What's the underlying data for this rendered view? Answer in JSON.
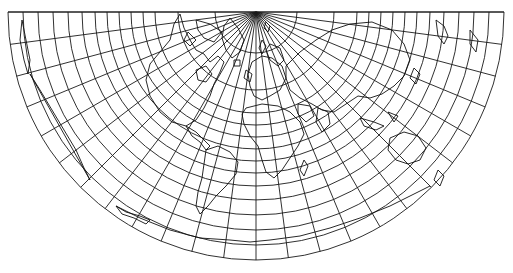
{
  "map": {
    "projection": "conic",
    "type": "world-graticule-with-coastlines",
    "colors": {
      "background": "#ffffff",
      "graticule": "#1a1a1a",
      "coastline": "#111111"
    },
    "apex": {
      "x": 256,
      "y": 12
    },
    "clip_top_y": 12,
    "outer_radius": 248,
    "fan_angle_start_deg": 0,
    "fan_angle_end_deg": 180,
    "meridian_step_map_deg": 7.5,
    "meridian_count": 25,
    "parallel_radii": [
      41,
      78,
      101,
      113,
      125,
      137,
      149,
      161,
      174,
      188,
      203,
      218,
      233,
      248
    ],
    "coastlines": [
      {
        "name": "greenland",
        "d": "M230 18 L238 28 L244 40 L240 52 L232 58 L226 50 L222 38 L224 26 Z"
      },
      {
        "name": "svalbard",
        "d": "M266 22 L270 26 L268 32 L264 28 Z"
      },
      {
        "name": "novaya-zemlya",
        "d": "M262 40 L266 46 L262 54 L259 48 Z"
      },
      {
        "name": "canadian-archipelago",
        "d": "M196 20 L210 24 L222 32 L214 42 L204 38 L198 30 Z M188 32 L196 40 L190 46 L184 40 Z"
      },
      {
        "name": "north-america",
        "d": "M180 14 L174 24 L170 40 L160 52 L150 64 L146 80 L150 96 L160 112 L172 122 L186 126 L196 120 L204 108 L210 96 L214 84 L220 72 L224 62 L218 56 L210 62 L204 54 L196 50 L190 40 L184 28 Z"
      },
      {
        "name": "hudson-bay",
        "d": "M196 70 L206 66 L212 74 L206 82 L198 80 Z"
      },
      {
        "name": "central-america",
        "d": "M186 126 L192 136 L200 142 L206 150 L210 146 L204 140 L196 132 Z"
      },
      {
        "name": "south-america",
        "d": "M206 150 L218 146 L230 152 L238 162 L236 174 L226 186 L216 196 L208 206 L200 214 L196 206 L198 192 L202 178 L204 164 Z"
      },
      {
        "name": "europe",
        "d": "M252 62 L262 56 L272 58 L282 66 L286 78 L280 90 L270 96 L262 100 L254 96 L250 86 L248 74 Z"
      },
      {
        "name": "scandinavia",
        "d": "M270 44 L280 48 L284 60 L278 66 L270 60 L266 50 Z"
      },
      {
        "name": "british-isles",
        "d": "M246 70 L252 74 L250 82 L244 78 Z"
      },
      {
        "name": "iceland",
        "d": "M234 60 L240 60 L240 66 L234 66 Z"
      },
      {
        "name": "africa",
        "d": "M246 108 L262 104 L278 106 L290 112 L300 122 L304 134 L298 146 L290 158 L282 170 L274 178 L266 172 L262 160 L258 146 L250 136 L244 124 L242 114 Z"
      },
      {
        "name": "madagascar",
        "d": "M304 160 L308 166 L304 176 L300 170 Z"
      },
      {
        "name": "asia",
        "d": "M286 66 L300 52 L316 40 L332 30 L350 24 L372 22 L392 30 L404 44 L410 60 L404 76 L394 86 L382 94 L370 98 L358 96 L346 104 L334 112 L322 110 L312 104 L300 98 L290 90 L286 78 Z"
      },
      {
        "name": "india",
        "d": "M318 108 L328 112 L330 124 L322 132 L316 122 Z"
      },
      {
        "name": "arabia",
        "d": "M298 104 L310 106 L314 116 L306 122 L298 114 Z"
      },
      {
        "name": "japan",
        "d": "M414 68 L420 74 L416 84 L410 78 Z"
      },
      {
        "name": "indonesia",
        "d": "M360 118 L374 122 L384 126 L376 130 L364 126 Z M388 112 L398 116 L394 122 Z"
      },
      {
        "name": "australia",
        "d": "M390 138 L404 132 L418 136 L426 148 L420 160 L408 164 L396 160 L388 150 Z"
      },
      {
        "name": "new-zealand",
        "d": "M438 170 L444 176 L440 186 L434 180 Z"
      },
      {
        "name": "alaska-kamchatka",
        "d": "M436 20 L444 26 L448 36 L444 44 L438 36 Z M470 30 L478 40 L476 52 L470 44 Z"
      },
      {
        "name": "alaska-west",
        "d": "M22 20 L26 40 L30 60 L28 74 L24 60 L20 40 Z"
      },
      {
        "name": "west-coast-na",
        "d": "M30 74 L40 90 L52 110 L64 130 L76 150 L84 168 L90 180 Z"
      },
      {
        "name": "antarctica-left",
        "d": "M116 206 L140 218 L170 230 L200 238 L230 240 L250 242 L270 240"
      },
      {
        "name": "antarctica-right",
        "d": "M270 240 L300 236 L330 228 L360 218 L390 206 L410 196 L430 186"
      },
      {
        "name": "antarctic-peninsula",
        "d": "M116 206 L126 212 L140 216 L150 220 L146 224 L134 218 L122 214 Z"
      }
    ]
  }
}
